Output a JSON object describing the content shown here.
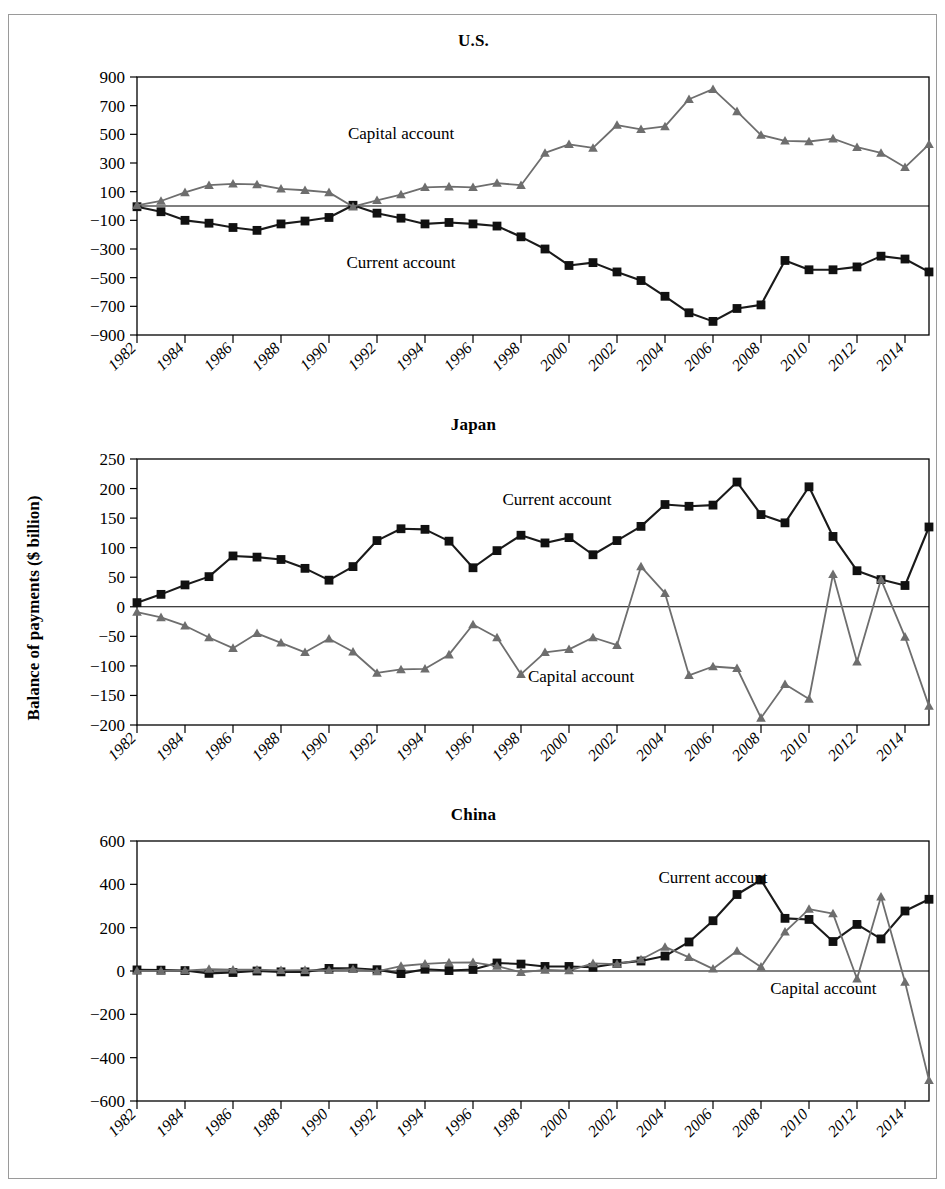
{
  "figure": {
    "y_axis_label": "Balance of payments ($ billion)",
    "series_names": {
      "current": "Current account",
      "capital": "Capital account"
    },
    "colors": {
      "current": "#111111",
      "capital": "#6E6E6E",
      "axis": "#000000",
      "frame": "#9A9A9A"
    }
  },
  "panels": [
    {
      "key": "us",
      "title": "U.S."
    },
    {
      "key": "jp",
      "title": "Japan"
    },
    {
      "key": "cn",
      "title": "China"
    }
  ],
  "chart_data": [
    {
      "type": "line",
      "title": "U.S.",
      "xlabel": "",
      "ylabel": "Balance of payments ($ billion)",
      "ylim": [
        -900,
        900
      ],
      "yticks": [
        -900,
        -700,
        -500,
        -300,
        -100,
        100,
        300,
        500,
        700,
        900
      ],
      "ytick_labels": [
        "−900",
        "−700",
        "−500",
        "−300",
        "−100",
        "100",
        "300",
        "500",
        "700",
        "900"
      ],
      "xlim": [
        1982,
        2015
      ],
      "xticks": [
        1982,
        1984,
        1986,
        1988,
        1990,
        1992,
        1994,
        1996,
        1998,
        2000,
        2002,
        2004,
        2006,
        2008,
        2010,
        2012,
        2014
      ],
      "xtick_labels": [
        "1982",
        "1984",
        "1986",
        "1988",
        "1990",
        "1992",
        "1994",
        "1996",
        "1998",
        "2000",
        "2002",
        "2004",
        "2006",
        "2008",
        "2010",
        "2012",
        "2014"
      ],
      "grid": false,
      "legend": "inline-annotations",
      "annotations": [
        {
          "text": "Capital account",
          "x": 1993.0,
          "y": 470
        },
        {
          "text": "Current account",
          "x": 1993.0,
          "y": -430
        }
      ],
      "x": [
        1982,
        1983,
        1984,
        1985,
        1986,
        1987,
        1988,
        1989,
        1990,
        1991,
        1992,
        1993,
        1994,
        1995,
        1996,
        1997,
        1998,
        1999,
        2000,
        2001,
        2002,
        2003,
        2004,
        2005,
        2006,
        2007,
        2008,
        2009,
        2010,
        2011,
        2012,
        2013,
        2014,
        2015
      ],
      "series": [
        {
          "name": "Current account",
          "marker": "square",
          "values": [
            -5,
            -40,
            -100,
            -120,
            -150,
            -170,
            -125,
            -105,
            -80,
            5,
            -50,
            -85,
            -125,
            -115,
            -125,
            -140,
            -215,
            -300,
            -415,
            -395,
            -460,
            -520,
            -630,
            -745,
            -805,
            -715,
            -690,
            -380,
            -445,
            -445,
            -425,
            -350,
            -370,
            -460
          ]
        },
        {
          "name": "Capital account",
          "marker": "triangle",
          "values": [
            5,
            35,
            95,
            145,
            155,
            150,
            120,
            110,
            95,
            -5,
            40,
            80,
            130,
            135,
            130,
            160,
            145,
            370,
            430,
            405,
            565,
            535,
            555,
            745,
            815,
            660,
            495,
            455,
            450,
            470,
            410,
            370,
            270,
            430
          ]
        }
      ]
    },
    {
      "type": "line",
      "title": "Japan",
      "xlabel": "",
      "ylabel": "Balance of payments ($ billion)",
      "ylim": [
        -200,
        250
      ],
      "yticks": [
        -200,
        -150,
        -100,
        -50,
        0,
        50,
        100,
        150,
        200,
        250
      ],
      "ytick_labels": [
        "−200",
        "−150",
        "−100",
        "−50",
        "0",
        "50",
        "100",
        "150",
        "200",
        "250"
      ],
      "xlim": [
        1982,
        2015
      ],
      "xticks": [
        1982,
        1984,
        1986,
        1988,
        1990,
        1992,
        1994,
        1996,
        1998,
        2000,
        2002,
        2004,
        2006,
        2008,
        2010,
        2012,
        2014
      ],
      "xtick_labels": [
        "1982",
        "1984",
        "1986",
        "1988",
        "1990",
        "1992",
        "1994",
        "1996",
        "1998",
        "2000",
        "2002",
        "2004",
        "2006",
        "2008",
        "2010",
        "2012",
        "2014"
      ],
      "grid": false,
      "legend": "inline-annotations",
      "annotations": [
        {
          "text": "Current account",
          "x": 1999.5,
          "y": 172
        },
        {
          "text": "Capital account",
          "x": 2000.5,
          "y": -128
        }
      ],
      "x": [
        1982,
        1983,
        1984,
        1985,
        1986,
        1987,
        1988,
        1989,
        1990,
        1991,
        1992,
        1993,
        1994,
        1995,
        1996,
        1997,
        1998,
        1999,
        2000,
        2001,
        2002,
        2003,
        2004,
        2005,
        2006,
        2007,
        2008,
        2009,
        2010,
        2011,
        2012,
        2013,
        2014,
        2015
      ],
      "series": [
        {
          "name": "Current account",
          "marker": "square",
          "values": [
            7,
            21,
            37,
            51,
            86,
            84,
            80,
            65,
            45,
            68,
            112,
            132,
            131,
            111,
            66,
            95,
            121,
            108,
            117,
            88,
            112,
            136,
            173,
            170,
            172,
            211,
            156,
            142,
            203,
            119,
            61,
            46,
            36,
            135
          ]
        },
        {
          "name": "Capital account",
          "marker": "triangle",
          "values": [
            -9,
            -18,
            -32,
            -52,
            -70,
            -45,
            -61,
            -77,
            -54,
            -76,
            -112,
            -106,
            -105,
            -81,
            -30,
            -52,
            -114,
            -77,
            -72,
            -52,
            -65,
            68,
            23,
            -116,
            -101,
            -104,
            -188,
            -131,
            -156,
            55,
            -93,
            46,
            -51,
            -168
          ]
        }
      ]
    },
    {
      "type": "line",
      "title": "China",
      "xlabel": "",
      "ylabel": "Balance of payments ($ billion)",
      "ylim": [
        -600,
        600
      ],
      "yticks": [
        -600,
        -400,
        -200,
        0,
        200,
        400,
        600
      ],
      "ytick_labels": [
        "−600",
        "−400",
        "−200",
        "0",
        "200",
        "400",
        "600"
      ],
      "xlim": [
        1982,
        2015
      ],
      "xticks": [
        1982,
        1984,
        1986,
        1988,
        1990,
        1992,
        1994,
        1996,
        1998,
        2000,
        2002,
        2004,
        2006,
        2008,
        2010,
        2012,
        2014
      ],
      "xtick_labels": [
        "1982",
        "1984",
        "1986",
        "1988",
        "1990",
        "1992",
        "1994",
        "1996",
        "1998",
        "2000",
        "2002",
        "2004",
        "2006",
        "2008",
        "2010",
        "2012",
        "2014"
      ],
      "grid": false,
      "legend": "inline-annotations",
      "annotations": [
        {
          "text": "Current account",
          "x": 2006.0,
          "y": 405
        },
        {
          "text": "Capital account",
          "x": 2010.6,
          "y": -105
        }
      ],
      "x": [
        1982,
        1983,
        1984,
        1985,
        1986,
        1987,
        1988,
        1989,
        1990,
        1991,
        1992,
        1993,
        1994,
        1995,
        1996,
        1997,
        1998,
        1999,
        2000,
        2001,
        2002,
        2003,
        2004,
        2005,
        2006,
        2007,
        2008,
        2009,
        2010,
        2011,
        2012,
        2013,
        2014,
        2015
      ],
      "series": [
        {
          "name": "Current account",
          "marker": "square",
          "values": [
            5,
            4,
            2,
            -11,
            -7,
            0,
            -4,
            -4,
            12,
            13,
            6,
            -12,
            8,
            2,
            7,
            37,
            32,
            21,
            21,
            17,
            35,
            46,
            69,
            134,
            232,
            353,
            420,
            243,
            238,
            136,
            215,
            148,
            277,
            331
          ]
        },
        {
          "name": "Capital account",
          "marker": "triangle",
          "values": [
            1,
            1,
            2,
            9,
            6,
            6,
            3,
            4,
            3,
            8,
            -2,
            23,
            33,
            39,
            40,
            23,
            -6,
            5,
            2,
            35,
            32,
            53,
            111,
            63,
            10,
            92,
            19,
            181,
            286,
            265,
            -36,
            343,
            -51,
            -504
          ]
        }
      ]
    }
  ]
}
